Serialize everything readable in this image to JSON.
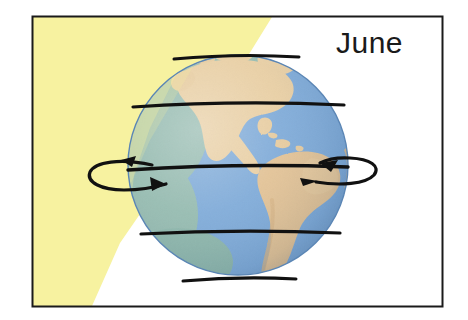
{
  "figure": {
    "kind": "seasons-earth-sunlight-diagram",
    "month_label": "June",
    "caption_text": "",
    "frame": {
      "border_color": "#1a1a1a",
      "background_color": "#ffffff",
      "x": 32,
      "y": 16,
      "width": 411,
      "height": 291
    },
    "sunlight": {
      "name": "sunlight-beam",
      "color": "#f7f2a0",
      "direction": "from upper-left",
      "description": "Yellow wedge of sunlight striking the Earth from the upper left, illuminating the Northern Hemisphere"
    },
    "globe": {
      "name": "earth-globe",
      "center_x": 238,
      "center_y": 165,
      "radius": 110,
      "ocean_color": "#7fabd9",
      "ocean_shadow_color": "#6e9ccd",
      "land_color": "#e3c396",
      "lit_land_color": "#efd3a7",
      "vegetation_color": "#9bc18c",
      "outline_color": "#3d6fa0",
      "visible_continents": [
        "North America",
        "Central America",
        "South America",
        "Greenland"
      ]
    },
    "latitude_lines": [
      {
        "name": "arctic-circle",
        "label": "Arctic Circle",
        "y": 58,
        "color": "#111111"
      },
      {
        "name": "tropic-of-cancer",
        "label": "Tropic of Cancer",
        "y": 106,
        "color": "#111111"
      },
      {
        "name": "equator",
        "label": "Equator",
        "y": 168,
        "color": "#111111"
      },
      {
        "name": "tropic-of-capricorn",
        "label": "Tropic of Capricorn",
        "y": 234,
        "color": "#111111"
      },
      {
        "name": "antarctic-circle",
        "label": "Antarctic Circle",
        "y": 279,
        "color": "#111111"
      }
    ],
    "rotation": {
      "name": "earth-rotation-arrows",
      "direction": "west to east (counterclockwise viewed from north)",
      "arrow_color": "#111111",
      "left_arrow_label": "",
      "right_arrow_label": ""
    }
  }
}
